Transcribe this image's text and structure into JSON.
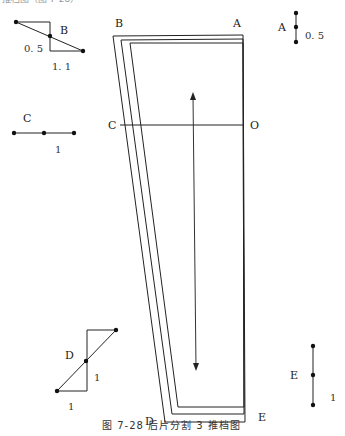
{
  "figure": {
    "caption": "图 7-28   后片分割 3 推档图",
    "top_cut_text": "推档图（图 7-28）",
    "colors": {
      "line": "#222222",
      "text": "#222222",
      "background": "#ffffff"
    }
  },
  "pattern_piece": {
    "points": {
      "A": "A",
      "B": "B",
      "C": "C",
      "O": "O",
      "D": "D",
      "E": "E"
    },
    "grainline": "double-arrow-vertical"
  },
  "grading_diagrams": {
    "A": {
      "label": "A",
      "value": "0. 5",
      "orientation": "vertical"
    },
    "B": {
      "label": "B",
      "value_vertical": "0. 5",
      "value_horizontal": "1. 1",
      "orientation": "diagonal"
    },
    "C": {
      "label": "C",
      "value": "1",
      "orientation": "horizontal"
    },
    "D": {
      "label": "D",
      "value_vertical": "1",
      "value_horizontal": "1",
      "orientation": "diagonal"
    },
    "E": {
      "label": "E",
      "value": "1",
      "orientation": "vertical"
    }
  }
}
